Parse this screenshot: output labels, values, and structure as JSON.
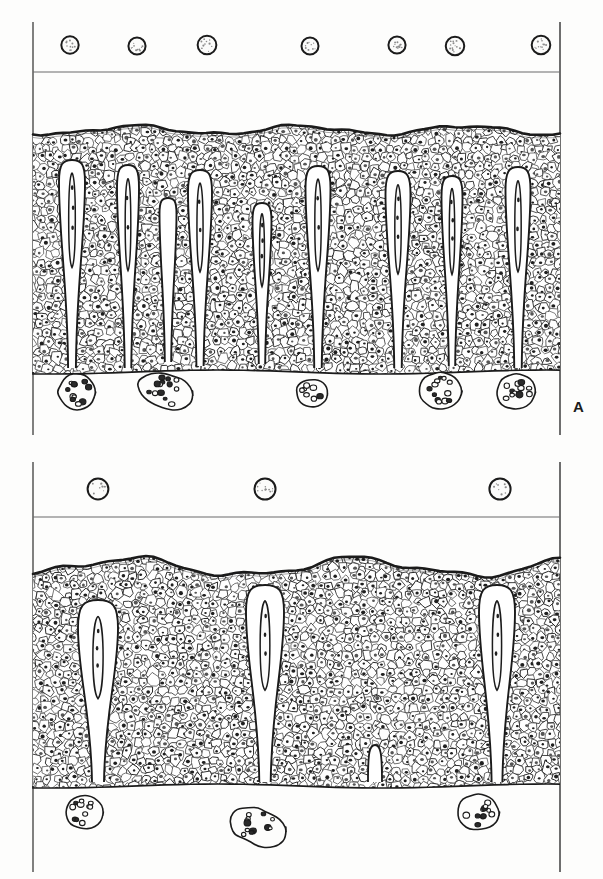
{
  "figure": {
    "illustration_style": "pen-and-ink line drawing",
    "background_color": "#ffffff",
    "ink_color": "#1b1b1b",
    "panel_count": 2
  },
  "panels": [
    {
      "id": "A",
      "label": "A",
      "label_position": "bottom-right",
      "frame": {
        "left_rule_x": 33,
        "right_rule_x": 560,
        "top_y": 22,
        "divider_y": 72,
        "bottom_y": 435
      },
      "free_cells_upper": {
        "name": "small-round-cells",
        "description": "small round granular cells above the lumen rule",
        "count": 7,
        "radius": 9,
        "centers": [
          {
            "cx": 70,
            "cy": 45
          },
          {
            "cx": 137,
            "cy": 46
          },
          {
            "cx": 207,
            "cy": 45
          },
          {
            "cx": 310,
            "cy": 46
          },
          {
            "cx": 397,
            "cy": 45
          },
          {
            "cx": 455,
            "cy": 46
          },
          {
            "cx": 541,
            "cy": 45
          }
        ]
      },
      "epithelium": {
        "name": "stratified-epithelium",
        "surface_top_y": 130,
        "base_y": 372,
        "surface_waviness": "gently undulating with a thick dark keratin rule",
        "cell_density": "high",
        "cell_count_estimate": 1450
      },
      "papillae": {
        "name": "dermal-papillae",
        "description": "narrow finger-like connective tissue papillae carrying capillary loops",
        "count": 9,
        "items": [
          {
            "x": 72,
            "top_y": 160,
            "bottom_y": 368,
            "width": 26,
            "bulb_y": 182,
            "capillary": true
          },
          {
            "x": 128,
            "top_y": 165,
            "bottom_y": 368,
            "width": 22,
            "bulb_y": 188,
            "capillary": true
          },
          {
            "x": 168,
            "top_y": 198,
            "bottom_y": 362,
            "width": 17,
            "bulb_y": 214,
            "capillary": false
          },
          {
            "x": 200,
            "top_y": 170,
            "bottom_y": 366,
            "width": 24,
            "bulb_y": 192,
            "capillary": true
          },
          {
            "x": 262,
            "top_y": 203,
            "bottom_y": 364,
            "width": 19,
            "bulb_y": 221,
            "capillary": true
          },
          {
            "x": 318,
            "top_y": 166,
            "bottom_y": 368,
            "width": 25,
            "bulb_y": 188,
            "capillary": true
          },
          {
            "x": 398,
            "top_y": 171,
            "bottom_y": 368,
            "width": 25,
            "bulb_y": 194,
            "capillary": true
          },
          {
            "x": 452,
            "top_y": 176,
            "bottom_y": 366,
            "width": 21,
            "bulb_y": 197,
            "capillary": true
          },
          {
            "x": 518,
            "top_y": 167,
            "bottom_y": 368,
            "width": 25,
            "bulb_y": 190,
            "capillary": true
          }
        ]
      },
      "free_cells_lower": {
        "name": "granular-cells",
        "description": "large pale cells filled with coarse cytoplasmic granules",
        "count": 5,
        "items": [
          {
            "cx": 77,
            "cy": 392,
            "rx": 19,
            "ry": 18,
            "granules": 11,
            "lobed": false
          },
          {
            "cx": 166,
            "cy": 391,
            "rx": 25,
            "ry": 20,
            "granules": 13,
            "lobed": true
          },
          {
            "cx": 312,
            "cy": 393,
            "rx": 16,
            "ry": 14,
            "granules": 7,
            "lobed": false
          },
          {
            "cx": 440,
            "cy": 391,
            "rx": 21,
            "ry": 19,
            "granules": 12,
            "lobed": false
          },
          {
            "cx": 516,
            "cy": 392,
            "rx": 20,
            "ry": 18,
            "granules": 11,
            "lobed": false
          }
        ]
      }
    },
    {
      "id": "B",
      "label": "B",
      "label_position": "bottom-right",
      "frame": {
        "left_rule_x": 33,
        "right_rule_x": 560,
        "top_y": 462,
        "divider_y": 517,
        "bottom_y": 872
      },
      "free_cells_upper": {
        "name": "small-round-cells",
        "description": "small round granular cells above the lumen rule",
        "count": 3,
        "radius": 10,
        "centers": [
          {
            "cx": 98,
            "cy": 489
          },
          {
            "cx": 265,
            "cy": 489
          },
          {
            "cx": 500,
            "cy": 489
          }
        ]
      },
      "epithelium": {
        "name": "stratified-epithelium",
        "surface_top_y": 567,
        "base_y": 786,
        "surface_waviness": "broadly undulating with a thick dark keratin rule",
        "cell_density": "high",
        "cell_count_estimate": 1300
      },
      "papillae": {
        "name": "dermal-papillae",
        "description": "few broad blunt papillae carrying capillary loops",
        "count": 3,
        "items": [
          {
            "x": 98,
            "top_y": 600,
            "bottom_y": 782,
            "width": 40,
            "bulb_y": 628,
            "capillary": true
          },
          {
            "x": 265,
            "top_y": 585,
            "bottom_y": 782,
            "width": 38,
            "bulb_y": 612,
            "capillary": true
          },
          {
            "x": 497,
            "top_y": 585,
            "bottom_y": 782,
            "width": 36,
            "bulb_y": 612,
            "capillary": true
          }
        ]
      },
      "rete_notch": {
        "name": "shallow-rete-notch",
        "x": 375,
        "top_y": 745,
        "bottom_y": 782,
        "width": 14
      },
      "free_cells_lower": {
        "name": "granular-cells",
        "description": "large pale cells filled with coarse cytoplasmic granules",
        "count": 3,
        "items": [
          {
            "cx": 84,
            "cy": 812,
            "rx": 19,
            "ry": 17,
            "granules": 11,
            "lobed": false
          },
          {
            "cx": 258,
            "cy": 827,
            "rx": 25,
            "ry": 21,
            "granules": 14,
            "lobed": true
          },
          {
            "cx": 478,
            "cy": 812,
            "rx": 21,
            "ry": 18,
            "granules": 11,
            "lobed": false
          }
        ]
      }
    }
  ],
  "legend": {
    "panel_a_note": "A",
    "panel_b_note": "B"
  }
}
